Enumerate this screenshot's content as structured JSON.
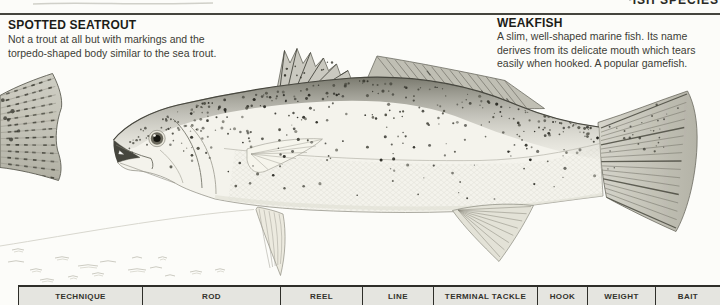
{
  "page": {
    "header_fragment": "FISH SPECIES"
  },
  "species": [
    {
      "name": "SPOTTED SEATROUT",
      "lines": [
        "Not a trout at all but with markings and the",
        "torpedo-shaped body similar to the sea trout."
      ]
    },
    {
      "name": "WEAKFISH",
      "lines": [
        "A slim, well-shaped marine fish. Its name",
        "derives from its delicate mouth which tears",
        "easily when hooked. A popular gamefish."
      ]
    }
  ],
  "illustration": {
    "main_fish": "Weakfish",
    "secondary_fish": "Spotted seatrout tail (cut off at left edge)"
  },
  "table": {
    "columns": [
      "TECHNIQUE",
      "ROD",
      "REEL",
      "LINE",
      "TERMINAL TACKLE",
      "HOOK",
      "WEIGHT",
      "BAIT"
    ]
  },
  "colors": {
    "rule": "#45453e",
    "heading_text": "#1c1c18",
    "body_text": "#3c3c36",
    "table_fill": "#e5e5e0",
    "table_border": "#2e2e29"
  }
}
